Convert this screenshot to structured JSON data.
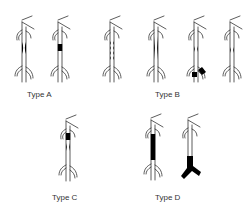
{
  "diagram": {
    "type_labels": {
      "a": "Type A",
      "b": "Type B",
      "c": "Type C",
      "d": "Type D"
    },
    "colors": {
      "vessel_line": "#333333",
      "lesion_fill": "#000000",
      "label_text": "#333333",
      "background": "#ffffff"
    },
    "groups": [
      {
        "label": "Type A",
        "vessels": [
          {
            "lesion": "concentric-narrowing",
            "description": "short stenosis with tapered edges"
          },
          {
            "lesion": "solid-block",
            "description": "short occlusion segment (black)"
          }
        ]
      },
      {
        "label": "Type B",
        "vessels": [
          {
            "lesion": "multiple-short-stenoses",
            "description": "several short narrowings in series"
          },
          {
            "lesion": "long-stenosis",
            "description": "elongated narrowing"
          },
          {
            "lesion": "stenosis-plus-bifurcation-occlusion",
            "description": "narrowing with black occlusion at lower branch"
          },
          {
            "lesion": "short-stenosis",
            "description": "single short narrowing"
          }
        ]
      },
      {
        "label": "Type C",
        "vessels": [
          {
            "lesion": "occlusion-plus-stenosis",
            "description": "short black occlusion followed by narrowing"
          }
        ]
      },
      {
        "label": "Type D",
        "vessels": [
          {
            "lesion": "long-occlusion",
            "description": "long black occluded segment"
          },
          {
            "lesion": "occlusion-involving-bifurcation",
            "description": "black occlusion extending into lower branches"
          }
        ]
      }
    ]
  }
}
